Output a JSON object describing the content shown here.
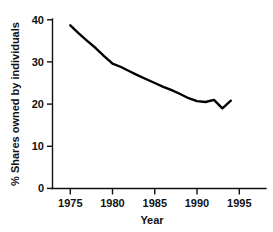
{
  "chart_data": {
    "type": "line",
    "title": "",
    "xlabel": "Year",
    "ylabel": "% Shares owned by individuals",
    "xlim": [
      1973.9,
      1997.0
    ],
    "ylim": [
      0,
      40
    ],
    "xticks": [
      1975,
      1980,
      1985,
      1990,
      1995
    ],
    "xtick_labels": [
      "1975",
      "1980",
      "1985",
      "1990",
      "1995"
    ],
    "yticks": [
      0,
      10,
      20,
      30,
      40
    ],
    "ytick_labels": [
      "0",
      "10",
      "20",
      "30",
      "40"
    ],
    "grid": false,
    "legend": "none",
    "line_color": "#000000",
    "series": [
      {
        "name": "% Shares owned by individuals",
        "x": [
          1975,
          1976,
          1977,
          1978,
          1979,
          1980,
          1981,
          1982,
          1983,
          1984,
          1985,
          1986,
          1987,
          1988,
          1989,
          1990,
          1991,
          1992,
          1993,
          1994
        ],
        "values": [
          38.7,
          36.8,
          35.0,
          33.3,
          31.4,
          29.6,
          28.8,
          27.8,
          26.8,
          25.9,
          25.0,
          24.1,
          23.3,
          22.4,
          21.4,
          20.7,
          20.5,
          21.0,
          19.0,
          20.8
        ]
      }
    ]
  },
  "axis": {
    "y_title": "% Shares owned by individuals",
    "x_title": "Year"
  }
}
